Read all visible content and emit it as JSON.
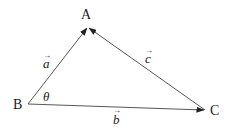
{
  "diagram": {
    "type": "vector-triangle",
    "points": {
      "A": {
        "label": "A",
        "x": 88,
        "y": 27
      },
      "B": {
        "label": "B",
        "x": 28,
        "y": 104
      },
      "C": {
        "label": "C",
        "x": 205,
        "y": 110
      }
    },
    "vectors": [
      {
        "name": "a",
        "from": "B",
        "to": "A",
        "label": "a"
      },
      {
        "name": "b",
        "from": "B",
        "to": "C",
        "label": "b"
      },
      {
        "name": "c",
        "from": "C",
        "to": "A",
        "label": "c"
      }
    ],
    "angle": {
      "label": "θ",
      "at": "B"
    },
    "arrow_glyph": "→",
    "colors": {
      "line": "#333333",
      "text": "#222222"
    }
  }
}
